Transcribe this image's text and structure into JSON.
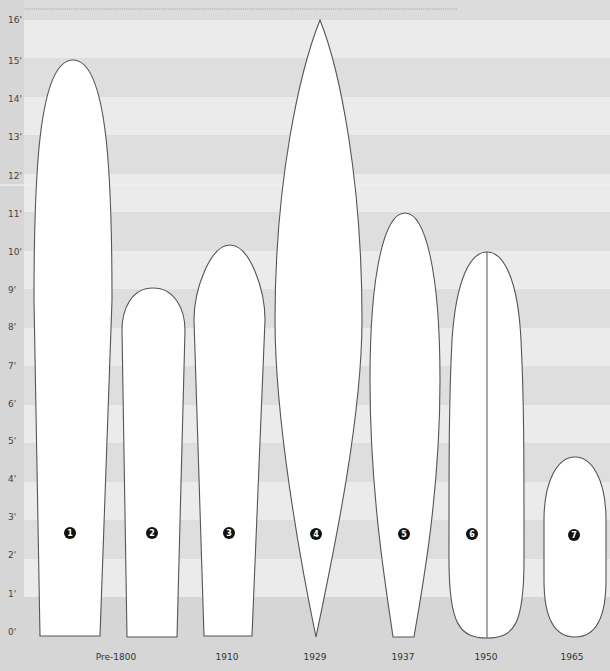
{
  "colors": {
    "background": "#dcdcdc",
    "label_column": "#d6d6d6",
    "stripe_light": "#ebebeb",
    "stripe_dark": "#dedede",
    "bottom_band": "#d6d6d6",
    "board_fill": "#ffffff",
    "board_stroke": "#555555",
    "marker_fill": "#111111",
    "marker_text": "#ffffff"
  },
  "chart_data": {
    "type": "diagram",
    "ylabel": "Length (feet)",
    "ylim": [
      0,
      16
    ],
    "y_ticks": [
      "0'",
      "1'",
      "2'",
      "3'",
      "4'",
      "5'",
      "6'",
      "7'",
      "8'",
      "9'",
      "10'",
      "11'",
      "12'",
      "13'",
      "14'",
      "15'",
      "16'"
    ],
    "categories": [
      "Pre-1800",
      "Pre-1800",
      "1910",
      "1929",
      "1937",
      "1950",
      "1965"
    ],
    "boards": [
      {
        "number": "1",
        "era": "Pre-1800",
        "length_ft": 15.0
      },
      {
        "number": "2",
        "era": "Pre-1800",
        "length_ft": 9.0
      },
      {
        "number": "3",
        "era": "1910",
        "length_ft": 10.1
      },
      {
        "number": "4",
        "era": "1929",
        "length_ft": 16.0
      },
      {
        "number": "5",
        "era": "1937",
        "length_ft": 11.0
      },
      {
        "number": "6",
        "era": "1950",
        "length_ft": 10.0
      },
      {
        "number": "7",
        "era": "1965",
        "length_ft": 4.6
      }
    ]
  },
  "axis": {
    "y_labels": [
      {
        "text": "16'",
        "y": 20
      },
      {
        "text": "15'",
        "y": 61
      },
      {
        "text": "14'",
        "y": 99
      },
      {
        "text": "13'",
        "y": 137
      },
      {
        "text": "12'",
        "y": 176
      },
      {
        "text": "11'",
        "y": 214
      },
      {
        "text": "10'",
        "y": 252
      },
      {
        "text": "9'",
        "y": 290
      },
      {
        "text": "8'",
        "y": 327
      },
      {
        "text": "7'",
        "y": 366
      },
      {
        "text": "6'",
        "y": 404
      },
      {
        "text": "5'",
        "y": 441
      },
      {
        "text": "4'",
        "y": 479
      },
      {
        "text": "3'",
        "y": 517
      },
      {
        "text": "2'",
        "y": 555
      },
      {
        "text": "1'",
        "y": 594
      },
      {
        "text": "0'",
        "y": 632
      }
    ],
    "x_labels": [
      {
        "text": "Pre-1800",
        "x": 116
      },
      {
        "text": "1910",
        "x": 227
      },
      {
        "text": "1929",
        "x": 315
      },
      {
        "text": "1937",
        "x": 403
      },
      {
        "text": "1950",
        "x": 486
      },
      {
        "text": "1965",
        "x": 572
      }
    ]
  },
  "boards": [
    {
      "number": "1",
      "cx": 70,
      "cy": 533
    },
    {
      "number": "2",
      "cx": 152,
      "cy": 533
    },
    {
      "number": "3",
      "cx": 229,
      "cy": 533
    },
    {
      "number": "4",
      "cx": 316,
      "cy": 534
    },
    {
      "number": "5",
      "cx": 404,
      "cy": 534
    },
    {
      "number": "6",
      "cx": 472,
      "cy": 534
    },
    {
      "number": "7",
      "cx": 574,
      "cy": 535
    }
  ]
}
